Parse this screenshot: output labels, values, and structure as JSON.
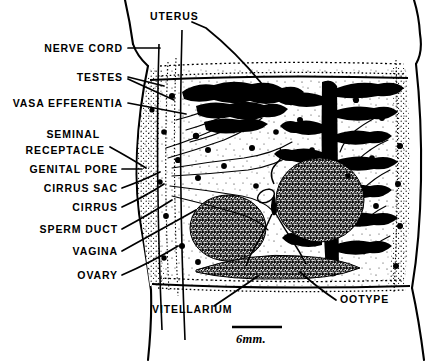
{
  "figure": {
    "type": "anatomical-diagram",
    "style": "black-and-white line drawing with stipple shading",
    "scale_bar": {
      "label": "6mm.",
      "bar_length_px": 50
    },
    "labels": [
      {
        "id": "uterus",
        "text": "UTERUS",
        "x": 150,
        "y": 16,
        "align": "left"
      },
      {
        "id": "nerve-cord",
        "text": "NERVE CORD",
        "x": 123,
        "y": 51,
        "align": "right"
      },
      {
        "id": "testes",
        "text": "TESTES",
        "x": 123,
        "y": 80,
        "align": "right"
      },
      {
        "id": "vasa-efferentia",
        "text": "VASA EFFERENTIA",
        "x": 123,
        "y": 106,
        "align": "right"
      },
      {
        "id": "seminal-receptacle",
        "text": "SEMINAL",
        "x": 100,
        "y": 135,
        "align": "right"
      },
      {
        "id": "seminal-receptacle2",
        "text": "RECEPTACLE",
        "x": 105,
        "y": 151,
        "align": "right"
      },
      {
        "id": "genital-pore",
        "text": "GENITAL PORE",
        "x": 118,
        "y": 172,
        "align": "right"
      },
      {
        "id": "cirrus-sac",
        "text": "CIRRUS SAC",
        "x": 118,
        "y": 191,
        "align": "right"
      },
      {
        "id": "cirrus",
        "text": "CIRRUS",
        "x": 118,
        "y": 210,
        "align": "right"
      },
      {
        "id": "sperm-duct",
        "text": "SPERM DUCT",
        "x": 118,
        "y": 232,
        "align": "right"
      },
      {
        "id": "vagina",
        "text": "VAGINA",
        "x": 118,
        "y": 254,
        "align": "right"
      },
      {
        "id": "ovary",
        "text": "OVARY",
        "x": 118,
        "y": 278,
        "align": "right"
      },
      {
        "id": "vitellarium",
        "text": "VITELLARIUM",
        "x": 152,
        "y": 311,
        "align": "left"
      },
      {
        "id": "ootype",
        "text": "OOTYPE",
        "x": 340,
        "y": 301,
        "align": "left"
      }
    ],
    "structures": [
      {
        "id": "body-wall",
        "name": "body wall outline"
      },
      {
        "id": "testes",
        "name": "testes (solid black lobes)",
        "count": 2
      },
      {
        "id": "vitellaria",
        "name": "vitellarium masses (granular)",
        "count": 3
      },
      {
        "id": "uterus",
        "name": "uterus (branched black mass)"
      },
      {
        "id": "ducts",
        "name": "reproductive ducts (fine lines)"
      }
    ]
  }
}
